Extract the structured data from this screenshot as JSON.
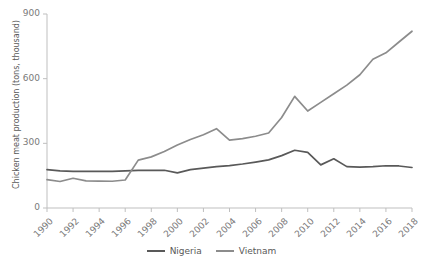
{
  "cropped_title_text": "Chicken meat production",
  "axes": {
    "y_label": "Chicken meat production (tons, thousand)",
    "y_ticks": [
      "0",
      "300",
      "600",
      "900"
    ],
    "x_ticks": [
      "1990",
      "1992",
      "1994",
      "1996",
      "1998",
      "2000",
      "2002",
      "2004",
      "2006",
      "2008",
      "2010",
      "2012",
      "2014",
      "2016",
      "2018"
    ]
  },
  "legend": {
    "items": [
      {
        "label": "Nigeria",
        "color": "#595959"
      },
      {
        "label": "Vietnam",
        "color": "#8c8c8c"
      }
    ]
  },
  "chart_data": {
    "type": "line",
    "title": "Chicken meat production",
    "xlabel": "",
    "ylabel": "Chicken meat production (tons, thousand)",
    "xlim": [
      1990,
      2018
    ],
    "ylim": [
      0,
      900
    ],
    "yticks": [
      0,
      300,
      600,
      900
    ],
    "xticks": [
      1990,
      1992,
      1994,
      1996,
      1998,
      2000,
      2002,
      2004,
      2006,
      2008,
      2010,
      2012,
      2014,
      2016,
      2018
    ],
    "grid": false,
    "legend_position": "bottom",
    "x": [
      1990,
      1991,
      1992,
      1993,
      1994,
      1995,
      1996,
      1997,
      1998,
      1999,
      2000,
      2001,
      2002,
      2003,
      2004,
      2005,
      2006,
      2007,
      2008,
      2009,
      2010,
      2011,
      2012,
      2013,
      2014,
      2015,
      2016,
      2017,
      2018
    ],
    "series": [
      {
        "name": "Nigeria",
        "color": "#595959",
        "values": [
          178,
          172,
          170,
          170,
          170,
          170,
          172,
          175,
          175,
          175,
          163,
          178,
          185,
          192,
          197,
          204,
          213,
          223,
          243,
          268,
          258,
          200,
          228,
          192,
          190,
          192,
          196,
          195,
          188
        ]
      },
      {
        "name": "Vietnam",
        "color": "#8c8c8c",
        "values": [
          132,
          123,
          138,
          126,
          125,
          124,
          130,
          222,
          237,
          262,
          292,
          318,
          340,
          368,
          315,
          322,
          333,
          348,
          420,
          518,
          450,
          490,
          530,
          570,
          618,
          690,
          720,
          770,
          820
        ]
      }
    ]
  }
}
